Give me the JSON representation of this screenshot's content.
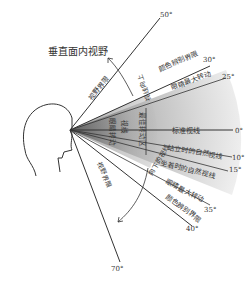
{
  "title": "垂直面内视野",
  "labels": {
    "visual_limit_upper": "视野界限",
    "color_limit_upper": "颜色辨别界限",
    "max_eye_rotation_upper": "眼睛最大转动",
    "max_eye_rotation_upper_deg": "25°",
    "standard_line": "标准视线",
    "standing_natural": "站立时的自然视线",
    "sitting_natural": "坐着时的自然视线",
    "max_eye_rotation_lower": "眼睛最大转动",
    "color_limit_lower": "颜色辨别界限",
    "visual_limit_lower": "视野界限",
    "optimal_zone": "最佳眼球转动区",
    "inner_label_1": "眼睛转动",
    "inner_label_2": "视线",
    "inner_label_3": "最佳转动区",
    "upper_arrow_label": "视线向上",
    "lower_arrow_label": "向下的视线"
  },
  "degrees": {
    "top": "50°",
    "color_upper": "30°",
    "eye_upper": "25°",
    "standard": "0°",
    "standing": "10°",
    "sitting": "15°",
    "eye_lower": "35°",
    "color_lower": "40°",
    "bottom": "70°"
  },
  "colors": {
    "line": "#333333",
    "fan_dark": "#9a9a9a",
    "fan_light": "#e6e6e6",
    "text": "#333333"
  }
}
